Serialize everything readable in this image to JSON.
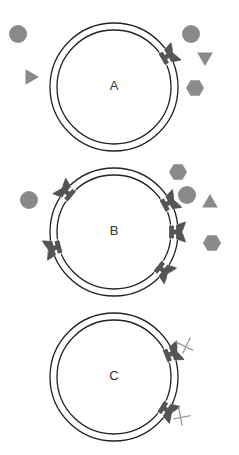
{
  "colors": {
    "membrane": "#222222",
    "receptor": "#555555",
    "ligand": "#8a8a8a",
    "blocker": "#9a9a9a",
    "background": "#ffffff"
  },
  "panels": [
    {
      "label": "A",
      "center": [
        114,
        87
      ],
      "outer_radius": 64,
      "inner_radius": 57,
      "receptors": [
        {
          "angle": -30,
          "blocked": false
        }
      ],
      "ligands": [
        {
          "shape": "circle",
          "x": 18,
          "y": 34,
          "size": 9
        },
        {
          "shape": "triangle-right",
          "x": 30,
          "y": 77,
          "size": 9
        },
        {
          "shape": "circle",
          "x": 191,
          "y": 34,
          "size": 9
        },
        {
          "shape": "triangle-down",
          "x": 205,
          "y": 57,
          "size": 9
        },
        {
          "shape": "hexagon",
          "x": 195,
          "y": 88,
          "size": 9
        }
      ]
    },
    {
      "label": "B",
      "center": [
        114,
        232
      ],
      "outer_radius": 64,
      "inner_radius": 57,
      "receptors": [
        {
          "angle": -140,
          "blocked": false
        },
        {
          "angle": -28,
          "blocked": false
        },
        {
          "angle": 0,
          "blocked": false
        },
        {
          "angle": 165,
          "blocked": false
        },
        {
          "angle": 38,
          "blocked": false
        }
      ],
      "ligands": [
        {
          "shape": "circle",
          "x": 29,
          "y": 200,
          "size": 9
        },
        {
          "shape": "hexagon",
          "x": 178,
          "y": 172,
          "size": 9
        },
        {
          "shape": "circle",
          "x": 187,
          "y": 195,
          "size": 9
        },
        {
          "shape": "triangle-up",
          "x": 210,
          "y": 203,
          "size": 9
        },
        {
          "shape": "hexagon",
          "x": 212,
          "y": 243,
          "size": 9
        }
      ]
    },
    {
      "label": "C",
      "center": [
        114,
        377
      ],
      "outer_radius": 64,
      "inner_radius": 57,
      "receptors": [
        {
          "angle": -22,
          "blocked": true
        },
        {
          "angle": 32,
          "blocked": true
        }
      ],
      "ligands": []
    }
  ]
}
